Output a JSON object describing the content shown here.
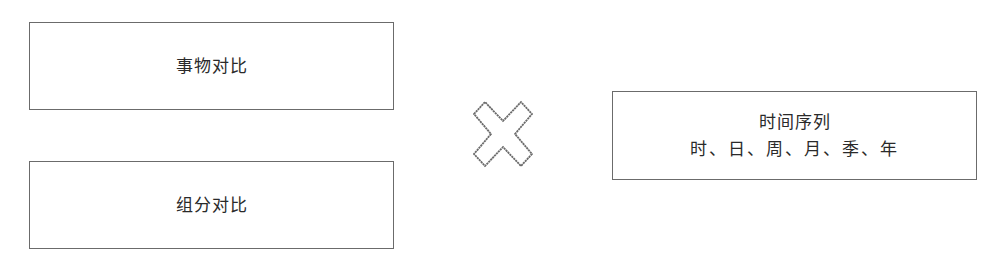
{
  "diagram": {
    "left_boxes": [
      {
        "label": "事物对比"
      },
      {
        "label": "组分对比"
      }
    ],
    "operator": {
      "icon": "cross-icon",
      "meaning": "×"
    },
    "right_box": {
      "title": "时间序列",
      "subtitle": "时、日、周、月、季、年"
    },
    "colors": {
      "border": "#6b6b6b",
      "text": "#2a2a2a",
      "background": "#ffffff"
    }
  }
}
